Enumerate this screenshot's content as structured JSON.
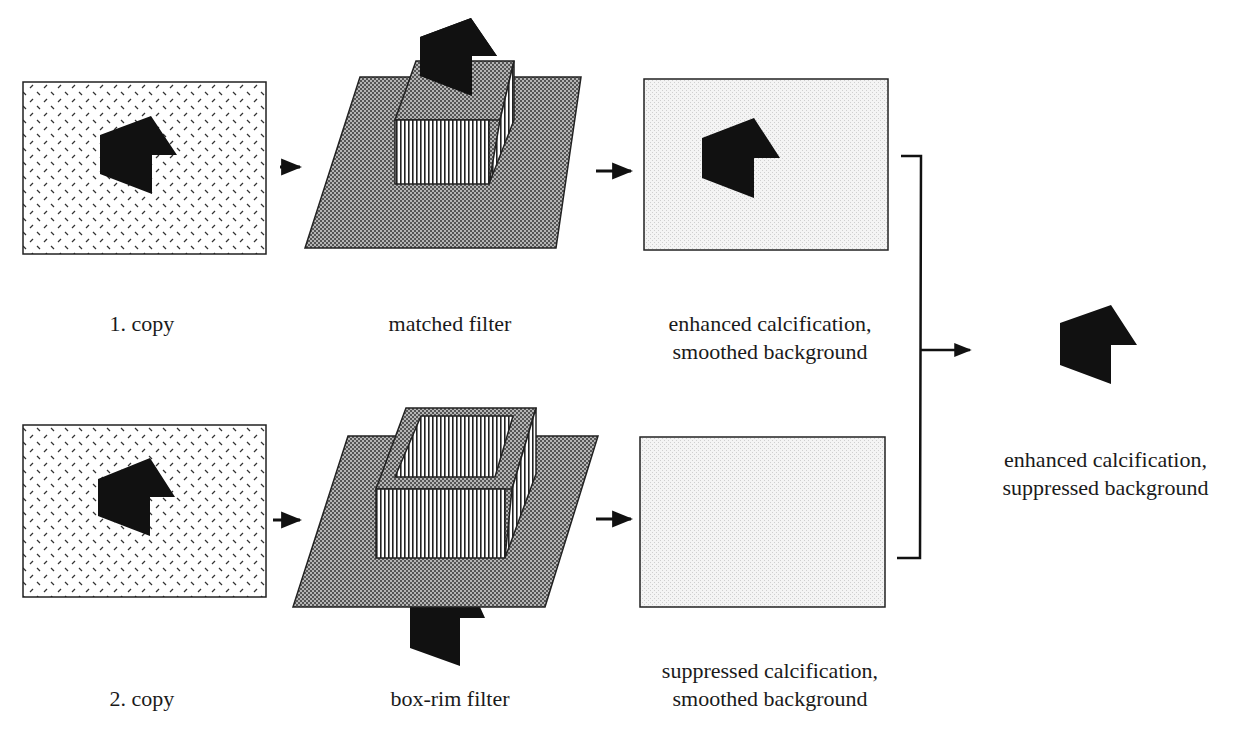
{
  "colors": {
    "background": "#ffffff",
    "ink": "#111111",
    "plane_fill": "#8c8c8c",
    "output_fill": "#efefef",
    "input_fill": "#ffffff"
  },
  "row1": {
    "input_label": "1. copy",
    "filter_label": "matched filter",
    "output_label_line1": "enhanced calcification,",
    "output_label_line2": "smoothed background"
  },
  "row2": {
    "input_label": "2. copy",
    "filter_label": "box-rim filter",
    "output_label_line1": "suppressed calcification,",
    "output_label_line2": "smoothed background"
  },
  "result": {
    "label_line1": "enhanced calcification,",
    "label_line2": "suppressed background"
  },
  "icons": {
    "calcification": "pentagon-arrow-shape",
    "flow_arrow": "right-arrow",
    "combine_bracket": "bracket-combiner"
  }
}
